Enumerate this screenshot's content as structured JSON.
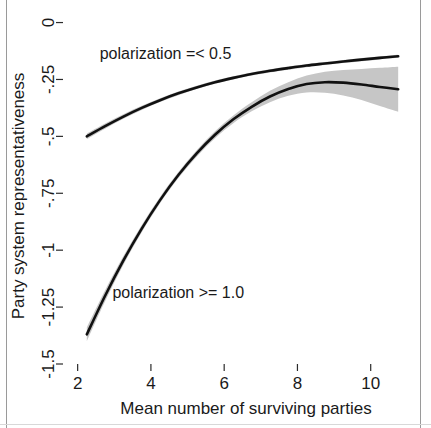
{
  "figure": {
    "background_color": "#ffffff",
    "frame_color": "#9a9a9a"
  },
  "chart_data": {
    "type": "line",
    "title": "",
    "subtitle": "",
    "xlabel": "Mean number of surviving parties",
    "ylabel": "Party system representativeness",
    "xlim": [
      1.6,
      11.1
    ],
    "ylim": [
      -1.5,
      0.02
    ],
    "xticks": [
      2,
      4,
      6,
      8,
      10
    ],
    "xtick_labels": [
      "2",
      "4",
      "6",
      "8",
      "10"
    ],
    "yticks": [
      0,
      -0.25,
      -0.5,
      -0.75,
      -1,
      -1.25,
      -1.5
    ],
    "ytick_labels": [
      "0",
      "-.25",
      "-.5",
      "-.75",
      "-1",
      "-1.25",
      "-1.5"
    ],
    "grid": false,
    "legend_position": "inline-annotations",
    "line_color": "#111111",
    "band_color": "#c6c6c6",
    "series": [
      {
        "name": "polarization =< 0.5",
        "annotation": "polarization =< 0.5",
        "annotation_x": 2.6,
        "annotation_y": -0.16,
        "x": [
          2.25,
          2.75,
          3.25,
          3.75,
          4.25,
          4.75,
          5.25,
          5.75,
          6.25,
          6.75,
          7.25,
          7.75,
          8.25,
          8.75,
          9.25,
          9.75,
          10.25,
          10.75
        ],
        "values": [
          -0.5,
          -0.455,
          -0.413,
          -0.375,
          -0.341,
          -0.311,
          -0.285,
          -0.262,
          -0.243,
          -0.226,
          -0.212,
          -0.2,
          -0.189,
          -0.18,
          -0.171,
          -0.163,
          -0.155,
          -0.148
        ],
        "band_lower": [
          -0.512,
          -0.466,
          -0.423,
          -0.384,
          -0.349,
          -0.319,
          -0.292,
          -0.269,
          -0.25,
          -0.233,
          -0.219,
          -0.207,
          -0.196,
          -0.187,
          -0.178,
          -0.17,
          -0.162,
          -0.155
        ],
        "band_upper": [
          -0.488,
          -0.444,
          -0.403,
          -0.366,
          -0.333,
          -0.303,
          -0.278,
          -0.255,
          -0.236,
          -0.219,
          -0.205,
          -0.193,
          -0.182,
          -0.173,
          -0.164,
          -0.156,
          -0.148,
          -0.141
        ]
      },
      {
        "name": "polarization >= 1.0",
        "annotation": "polarization >= 1.0",
        "annotation_x": 2.95,
        "annotation_y": -1.21,
        "x": [
          2.25,
          2.75,
          3.25,
          3.75,
          4.25,
          4.75,
          5.25,
          5.75,
          6.25,
          6.75,
          7.25,
          7.75,
          8.25,
          8.75,
          9.25,
          9.75,
          10.25,
          10.75
        ],
        "values": [
          -1.37,
          -1.2,
          -1.045,
          -0.905,
          -0.78,
          -0.67,
          -0.575,
          -0.493,
          -0.425,
          -0.37,
          -0.325,
          -0.292,
          -0.27,
          -0.262,
          -0.264,
          -0.272,
          -0.283,
          -0.293
        ],
        "band_lower": [
          -1.4,
          -1.224,
          -1.064,
          -0.921,
          -0.794,
          -0.683,
          -0.589,
          -0.508,
          -0.442,
          -0.39,
          -0.35,
          -0.322,
          -0.307,
          -0.308,
          -0.32,
          -0.34,
          -0.367,
          -0.392
        ],
        "band_upper": [
          -1.34,
          -1.176,
          -1.026,
          -0.889,
          -0.766,
          -0.657,
          -0.561,
          -0.478,
          -0.408,
          -0.35,
          -0.3,
          -0.262,
          -0.233,
          -0.216,
          -0.208,
          -0.204,
          -0.199,
          -0.194
        ]
      }
    ]
  }
}
